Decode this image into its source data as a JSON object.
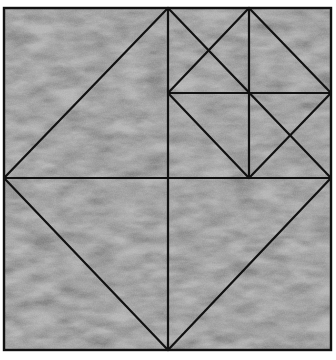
{
  "figure": {
    "width": 336,
    "height": 360,
    "background_color": "#ffffff",
    "fill_color": "#b4b4b4",
    "stroke_color": "#111111",
    "stroke_width": 2.2,
    "outer_square": {
      "x": 4,
      "y": 8,
      "w": 327,
      "h": 342
    },
    "lines": [
      {
        "id": "diamond-top-left",
        "x1": 168,
        "y1": 8,
        "x2": 4,
        "y2": 178
      },
      {
        "id": "diamond-bottom-left",
        "x1": 4,
        "y1": 178,
        "x2": 168,
        "y2": 350
      },
      {
        "id": "diamond-bottom-right",
        "x1": 168,
        "y1": 350,
        "x2": 331,
        "y2": 178
      },
      {
        "id": "diamond-top-right",
        "x1": 331,
        "y1": 178,
        "x2": 168,
        "y2": 8
      },
      {
        "id": "horizontal-middle",
        "x1": 4,
        "y1": 178,
        "x2": 331,
        "y2": 178
      },
      {
        "id": "vertical-middle",
        "x1": 168,
        "y1": 8,
        "x2": 168,
        "y2": 350
      },
      {
        "id": "vertical-quarter",
        "x1": 249,
        "y1": 8,
        "x2": 249,
        "y2": 178
      },
      {
        "id": "horizontal-quarter",
        "x1": 168,
        "y1": 93,
        "x2": 331,
        "y2": 93
      },
      {
        "id": "small-diamond-tl",
        "x1": 249,
        "y1": 8,
        "x2": 168,
        "y2": 93
      },
      {
        "id": "small-diamond-bl",
        "x1": 168,
        "y1": 93,
        "x2": 249,
        "y2": 178
      },
      {
        "id": "small-diamond-br",
        "x1": 249,
        "y1": 178,
        "x2": 331,
        "y2": 93
      },
      {
        "id": "small-diamond-tr",
        "x1": 331,
        "y1": 93,
        "x2": 249,
        "y2": 8
      }
    ]
  }
}
